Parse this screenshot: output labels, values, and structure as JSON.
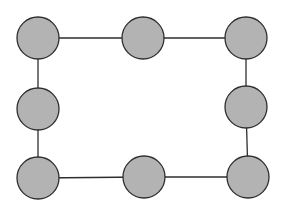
{
  "diagram": {
    "type": "graph",
    "colors": {
      "node_fill": "#b3b3b3",
      "node_stroke": "#2e2e2e",
      "edge": "#2e2e2e",
      "background": "#ffffff"
    },
    "node_radius": 21,
    "nodes": [
      {
        "id": "n1",
        "x": 38,
        "y": 38
      },
      {
        "id": "n2",
        "x": 143,
        "y": 38
      },
      {
        "id": "n3",
        "x": 246,
        "y": 38
      },
      {
        "id": "n4",
        "x": 246,
        "y": 107
      },
      {
        "id": "n5",
        "x": 248,
        "y": 177
      },
      {
        "id": "n6",
        "x": 144,
        "y": 177
      },
      {
        "id": "n7",
        "x": 38,
        "y": 178
      },
      {
        "id": "n8",
        "x": 38,
        "y": 109
      }
    ],
    "edges": [
      [
        "n1",
        "n2"
      ],
      [
        "n2",
        "n3"
      ],
      [
        "n3",
        "n4"
      ],
      [
        "n4",
        "n5"
      ],
      [
        "n5",
        "n6"
      ],
      [
        "n6",
        "n7"
      ],
      [
        "n7",
        "n8"
      ],
      [
        "n8",
        "n1"
      ]
    ]
  }
}
